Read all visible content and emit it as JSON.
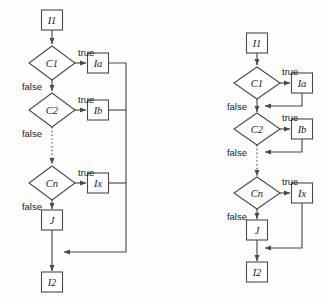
{
  "figure": {
    "kind": "flowchart-pair",
    "background_color": "#fdfdfc",
    "stroke_color": "#4a4a4a",
    "text_color": "#1a1a1a",
    "width": 328,
    "height": 302
  },
  "labels": {
    "true": "true",
    "false": "false"
  },
  "diagrams": [
    {
      "id": "left-flowchart",
      "name": "flowchart-left",
      "nodes": [
        {
          "id": "l-i1",
          "name": "node-i1",
          "shape": "box",
          "label": "I1",
          "cx": 52,
          "cy": 20,
          "w": 21,
          "h": 20
        },
        {
          "id": "l-c1",
          "name": "node-c1",
          "shape": "diamond",
          "label": "C1",
          "cx": 52,
          "cy": 63,
          "w": 46,
          "h": 34
        },
        {
          "id": "l-ia",
          "name": "node-ia",
          "shape": "box",
          "label": "Ia",
          "cx": 98,
          "cy": 63,
          "w": 21,
          "h": 20
        },
        {
          "id": "l-c2",
          "name": "node-c2",
          "shape": "diamond",
          "label": "C2",
          "cx": 52,
          "cy": 110,
          "w": 46,
          "h": 34
        },
        {
          "id": "l-ib",
          "name": "node-ib",
          "shape": "box",
          "label": "Ib",
          "cx": 98,
          "cy": 110,
          "w": 21,
          "h": 20
        },
        {
          "id": "l-cn",
          "name": "node-cn",
          "shape": "diamond",
          "label": "Cn",
          "cx": 52,
          "cy": 183,
          "w": 46,
          "h": 34
        },
        {
          "id": "l-ix",
          "name": "node-ix",
          "shape": "box",
          "label": "Ix",
          "cx": 98,
          "cy": 183,
          "w": 21,
          "h": 20
        },
        {
          "id": "l-j",
          "name": "node-j",
          "shape": "box",
          "label": "J",
          "cx": 52,
          "cy": 220,
          "w": 21,
          "h": 20
        },
        {
          "id": "l-i2",
          "name": "node-i2",
          "shape": "box",
          "label": "I2",
          "cx": 52,
          "cy": 282,
          "w": 21,
          "h": 20
        }
      ],
      "edges": [
        {
          "id": "l-e-i1-c1",
          "name": "edge-i1-to-c1",
          "d": "M 52 30 L 52 44",
          "arrow": true,
          "dotted": false
        },
        {
          "id": "l-e-c1-ia",
          "name": "edge-c1-to-ia",
          "d": "M 75 63 L 86 63",
          "arrow": true,
          "dotted": false
        },
        {
          "id": "l-e-c1-c2",
          "name": "edge-c1-to-c2",
          "d": "M 52 80 L 52 91",
          "arrow": true,
          "dotted": false
        },
        {
          "id": "l-e-c2-ib",
          "name": "edge-c2-to-ib",
          "d": "M 75 110 L 86 110",
          "arrow": true,
          "dotted": false
        },
        {
          "id": "l-e-c2-cn",
          "name": "edge-c2-to-cn",
          "d": "M 52 127 L 52 164",
          "arrow": true,
          "dotted": true
        },
        {
          "id": "l-e-cn-ix",
          "name": "edge-cn-to-ix",
          "d": "M 75 183 L 86 183",
          "arrow": true,
          "dotted": false
        },
        {
          "id": "l-e-cn-j",
          "name": "edge-cn-to-j",
          "d": "M 52 200 L 52 209",
          "arrow": true,
          "dotted": false
        },
        {
          "id": "l-e-j-i2",
          "name": "edge-j-to-i2",
          "d": "M 52 230 L 52 271",
          "arrow": true,
          "dotted": false
        },
        {
          "id": "l-e-ia-m",
          "name": "edge-ia-to-merge",
          "d": "M 109 63 L 126 63 L 126 252 L 64 252",
          "arrow": true,
          "dotted": false
        },
        {
          "id": "l-e-ib-m",
          "name": "edge-ib-to-merge",
          "d": "M 109 110 L 126 110",
          "arrow": false,
          "dotted": false
        },
        {
          "id": "l-e-ix-m",
          "name": "edge-ix-to-merge",
          "d": "M 109 183 L 126 183",
          "arrow": false,
          "dotted": false
        }
      ],
      "edge_labels": [
        {
          "id": "l-t1",
          "name": "edge-label-true-c1",
          "text": "true",
          "x": 78,
          "y": 52,
          "anchor": "start"
        },
        {
          "id": "l-t2",
          "name": "edge-label-true-c2",
          "text": "true",
          "x": 78,
          "y": 99,
          "anchor": "start"
        },
        {
          "id": "l-t3",
          "name": "edge-label-true-cn",
          "text": "true",
          "x": 78,
          "y": 172,
          "anchor": "start"
        },
        {
          "id": "l-f1",
          "name": "edge-label-false-c1",
          "text": "false",
          "x": 42,
          "y": 86,
          "anchor": "end"
        },
        {
          "id": "l-f2",
          "name": "edge-label-false-c2",
          "text": "false",
          "x": 42,
          "y": 133,
          "anchor": "end"
        },
        {
          "id": "l-f3",
          "name": "edge-label-false-cn",
          "text": "false",
          "x": 42,
          "y": 206,
          "anchor": "end"
        }
      ]
    },
    {
      "id": "right-flowchart",
      "name": "flowchart-right",
      "nodes": [
        {
          "id": "r-i1",
          "name": "node-i1",
          "shape": "box",
          "label": "I1",
          "cx": 257,
          "cy": 43,
          "w": 21,
          "h": 20
        },
        {
          "id": "r-c1",
          "name": "node-c1",
          "shape": "diamond",
          "label": "C1",
          "cx": 257,
          "cy": 83,
          "w": 46,
          "h": 32
        },
        {
          "id": "r-ia",
          "name": "node-ia",
          "shape": "box",
          "label": "Ia",
          "cx": 302,
          "cy": 83,
          "w": 21,
          "h": 20
        },
        {
          "id": "r-c2",
          "name": "node-c2",
          "shape": "diamond",
          "label": "C2",
          "cx": 257,
          "cy": 129,
          "w": 46,
          "h": 32
        },
        {
          "id": "r-ib",
          "name": "node-ib",
          "shape": "box",
          "label": "Ib",
          "cx": 302,
          "cy": 129,
          "w": 21,
          "h": 20
        },
        {
          "id": "r-cn",
          "name": "node-cn",
          "shape": "diamond",
          "label": "Cn",
          "cx": 257,
          "cy": 193,
          "w": 46,
          "h": 32
        },
        {
          "id": "r-ix",
          "name": "node-ix",
          "shape": "box",
          "label": "Ix",
          "cx": 302,
          "cy": 193,
          "w": 21,
          "h": 20
        },
        {
          "id": "r-j",
          "name": "node-j",
          "shape": "box",
          "label": "J",
          "cx": 257,
          "cy": 230,
          "w": 21,
          "h": 20
        },
        {
          "id": "r-i2",
          "name": "node-i2",
          "shape": "box",
          "label": "I2",
          "cx": 257,
          "cy": 272,
          "w": 21,
          "h": 20
        }
      ],
      "edges": [
        {
          "id": "r-e-i1-c1",
          "name": "edge-i1-to-c1",
          "d": "M 257 53 L 257 65",
          "arrow": true,
          "dotted": false
        },
        {
          "id": "r-e-c1-ia",
          "name": "edge-c1-to-ia",
          "d": "M 280 83 L 290 83",
          "arrow": true,
          "dotted": false
        },
        {
          "id": "r-e-ia-m1",
          "name": "edge-ia-to-merge",
          "d": "M 302 93 L 302 106 L 265 106",
          "arrow": true,
          "dotted": false
        },
        {
          "id": "r-e-c1-c2",
          "name": "edge-c1-to-c2",
          "d": "M 257 99 L 257 112",
          "arrow": true,
          "dotted": false
        },
        {
          "id": "r-e-c2-ib",
          "name": "edge-c2-to-ib",
          "d": "M 280 129 L 290 129",
          "arrow": true,
          "dotted": false
        },
        {
          "id": "r-e-ib-m2",
          "name": "edge-ib-to-merge",
          "d": "M 302 139 L 302 152 L 265 152",
          "arrow": true,
          "dotted": false
        },
        {
          "id": "r-e-c2-cn",
          "name": "edge-c2-to-cn",
          "d": "M 257 145 L 257 176",
          "arrow": true,
          "dotted": true
        },
        {
          "id": "r-e-cn-ix",
          "name": "edge-cn-to-ix",
          "d": "M 280 193 L 290 193",
          "arrow": true,
          "dotted": false
        },
        {
          "id": "r-e-cn-j",
          "name": "edge-cn-to-j",
          "d": "M 257 209 L 257 219",
          "arrow": true,
          "dotted": false
        },
        {
          "id": "r-e-ix-m3",
          "name": "edge-ix-to-merge",
          "d": "M 302 203 L 302 248 L 265 248",
          "arrow": true,
          "dotted": false
        },
        {
          "id": "r-e-j-i2",
          "name": "edge-j-to-i2",
          "d": "M 257 240 L 257 261",
          "arrow": true,
          "dotted": false
        }
      ],
      "edge_labels": [
        {
          "id": "r-t1",
          "name": "edge-label-true-c1",
          "text": "true",
          "x": 282,
          "y": 71,
          "anchor": "start"
        },
        {
          "id": "r-t2",
          "name": "edge-label-true-c2",
          "text": "true",
          "x": 282,
          "y": 117,
          "anchor": "start"
        },
        {
          "id": "r-t3",
          "name": "edge-label-true-cn",
          "text": "true",
          "x": 282,
          "y": 181,
          "anchor": "start"
        },
        {
          "id": "r-f1",
          "name": "edge-label-false-c1",
          "text": "false",
          "x": 247,
          "y": 106,
          "anchor": "end"
        },
        {
          "id": "r-f2",
          "name": "edge-label-false-c2",
          "text": "false",
          "x": 247,
          "y": 152,
          "anchor": "end"
        },
        {
          "id": "r-f3",
          "name": "edge-label-false-cn",
          "text": "false",
          "x": 247,
          "y": 216,
          "anchor": "end"
        }
      ]
    }
  ]
}
